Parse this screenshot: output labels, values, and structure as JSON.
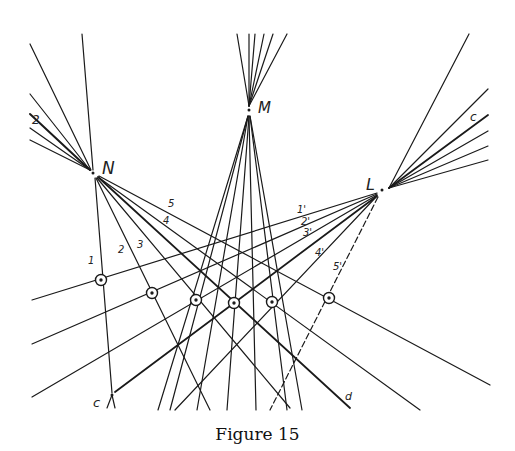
{
  "figure": {
    "caption": "Figure 15",
    "ink_color": "#1a1a1a",
    "background": "#ffffff"
  },
  "points": {
    "N": {
      "label": "N",
      "x": 93,
      "y": 172
    },
    "M": {
      "label": "M",
      "x": 249,
      "y": 110
    },
    "L": {
      "label": "L",
      "x": 380,
      "y": 190
    },
    "C": {
      "label": "c",
      "x": 112,
      "y": 395
    }
  },
  "ray_labels": {
    "N_rays": [
      "1",
      "2",
      "3",
      "4",
      "5"
    ],
    "L_rays": [
      "1'",
      "2'",
      "3'",
      "4'",
      "5'"
    ],
    "upper_left": "2",
    "upper_right": "c",
    "bottom_right": "d"
  },
  "circled_points": [
    {
      "x": 101,
      "y": 280
    },
    {
      "x": 152,
      "y": 293
    },
    {
      "x": 196,
      "y": 300
    },
    {
      "x": 234,
      "y": 303
    },
    {
      "x": 272,
      "y": 302
    },
    {
      "x": 329,
      "y": 298
    }
  ]
}
